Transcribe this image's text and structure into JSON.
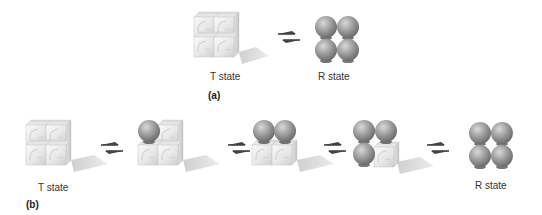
{
  "figure": {
    "panel_a": {
      "label": "(a)",
      "states": [
        {
          "name": "T state",
          "caption": "T state",
          "spheres": 0,
          "cubes": 4
        },
        {
          "name": "R state",
          "caption": "R state",
          "spheres": 4,
          "cubes": 0
        }
      ],
      "arrows": [
        "equilibrium-arrows"
      ]
    },
    "panel_b": {
      "label": "(b)",
      "states": [
        {
          "name": "T state",
          "caption": "T state",
          "spheres": 0,
          "cubes": 4
        },
        {
          "name": "intermediate-1",
          "caption": "",
          "spheres": 1,
          "cubes": 3
        },
        {
          "name": "intermediate-2",
          "caption": "",
          "spheres": 2,
          "cubes": 2
        },
        {
          "name": "intermediate-3",
          "caption": "",
          "spheres": 3,
          "cubes": 1
        },
        {
          "name": "R state",
          "caption": "R state",
          "spheres": 4,
          "cubes": 0
        }
      ],
      "arrows": [
        "equilibrium-arrows",
        "equilibrium-arrows",
        "equilibrium-arrows",
        "equilibrium-arrows"
      ]
    }
  },
  "colors": {
    "cube_light": "#f4f4f4",
    "cube_mid": "#d8d8d8",
    "cube_edge": "#b8b8b8",
    "shadow": "#dcdcdc",
    "sphere_light": "#cfcfcf",
    "sphere_dark": "#7a7a7a",
    "arrow": "#444444"
  }
}
